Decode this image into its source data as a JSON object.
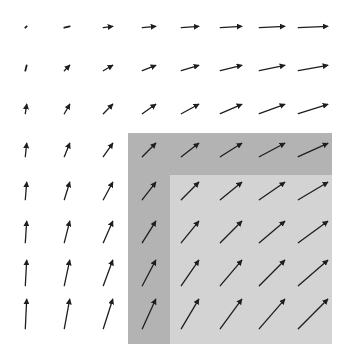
{
  "figure": {
    "type": "vector-field",
    "grid": {
      "cols": 8,
      "rows": 8,
      "origin_x": 26,
      "origin_y": 27,
      "spacing_x": 41,
      "spacing_y": 41
    },
    "field": {
      "description": "v(c, r) = (c, r) scaled; dx to the right, dy upward on screen",
      "scale_px_per_unit": 4.0,
      "offset": 0.35
    },
    "arrow_color": "#1e1e1e",
    "background_color": "#ffffff",
    "regions": [
      {
        "name": "outer-shaded-region",
        "x": 128,
        "y": 133,
        "width": 204,
        "height": 211,
        "color": "#b3b3b3"
      },
      {
        "name": "inner-light-region",
        "x": 170,
        "y": 175,
        "width": 162,
        "height": 169,
        "color": "#d3d3d3"
      }
    ]
  }
}
